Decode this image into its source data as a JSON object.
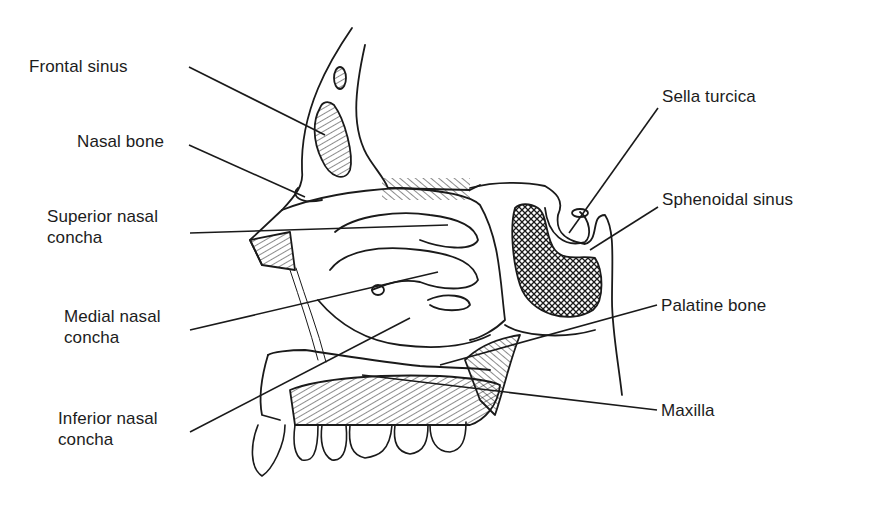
{
  "diagram": {
    "colors": {
      "ink": "#1a1a1a",
      "background": "#ffffff"
    },
    "labels_left": [
      {
        "id": "frontal-sinus",
        "text": "Frontal sinus",
        "x": 29,
        "y": 56,
        "line": [
          189,
          67,
          325,
          135
        ]
      },
      {
        "id": "nasal-bone",
        "text": "Nasal bone",
        "x": 77,
        "y": 131,
        "line": [
          189,
          145,
          305,
          197
        ]
      },
      {
        "id": "superior-nasal-concha",
        "text": "Superior nasal\nconcha",
        "x": 47,
        "y": 206,
        "line": [
          190,
          233,
          448,
          225
        ]
      },
      {
        "id": "medial-nasal-concha",
        "text": "Medial nasal\nconcha",
        "x": 64,
        "y": 306,
        "line": [
          190,
          330,
          438,
          272
        ]
      },
      {
        "id": "inferior-nasal-concha",
        "text": "Inferior nasal\nconcha",
        "x": 58,
        "y": 408,
        "line": [
          190,
          432,
          410,
          318
        ]
      }
    ],
    "labels_right": [
      {
        "id": "sella-turcica",
        "text": "Sella turcica",
        "x": 662,
        "y": 86,
        "line": [
          658,
          108,
          569,
          233
        ]
      },
      {
        "id": "sphenoidal-sinus",
        "text": "Sphenoidal sinus",
        "x": 662,
        "y": 189,
        "line": [
          658,
          207,
          590,
          250
        ]
      },
      {
        "id": "palatine-bone",
        "text": "Palatine bone",
        "x": 661,
        "y": 295,
        "line": [
          657,
          305,
          440,
          365
        ]
      },
      {
        "id": "maxilla",
        "text": "Maxilla",
        "x": 661,
        "y": 400,
        "line": [
          657,
          410,
          362,
          375
        ]
      }
    ]
  }
}
